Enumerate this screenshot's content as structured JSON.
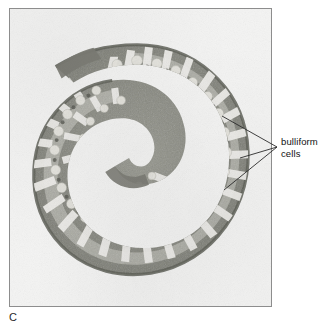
{
  "figure": {
    "letter": "C",
    "type": "light micrograph",
    "background_color": "#f3f3f3",
    "border_color": "#8d8d8d",
    "tissue_dark_color": "#6e6f68",
    "tissue_mid_color": "#8d8e86",
    "tissue_light_color": "#b9b9b2"
  },
  "annotations": {
    "bulliform": {
      "label": "bulliform cells",
      "line1": "bulliform",
      "line2": "cells",
      "text_color": "#111111",
      "leader_color": "#2b2b2b",
      "converge_x": 277,
      "converge_y": 147,
      "targets": [
        {
          "x": 222,
          "y": 116
        },
        {
          "x": 240,
          "y": 158
        },
        {
          "x": 224,
          "y": 190
        }
      ]
    }
  },
  "frame": {
    "left": 9,
    "top": 8,
    "width": 263,
    "height": 299
  }
}
